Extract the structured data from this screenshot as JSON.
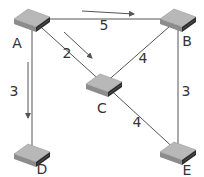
{
  "diagram": {
    "type": "network-graph",
    "nodes": [
      {
        "id": "A",
        "label": "A"
      },
      {
        "id": "B",
        "label": "B"
      },
      {
        "id": "C",
        "label": "C"
      },
      {
        "id": "D",
        "label": "D"
      },
      {
        "id": "E",
        "label": "E"
      }
    ],
    "edges": [
      {
        "from": "A",
        "to": "B",
        "weight": "5",
        "direction_arrow": true
      },
      {
        "from": "A",
        "to": "C",
        "weight": "2",
        "direction_arrow": true
      },
      {
        "from": "A",
        "to": "D",
        "weight": "3",
        "direction_arrow": true
      },
      {
        "from": "C",
        "to": "B",
        "weight": "4",
        "direction_arrow": false
      },
      {
        "from": "C",
        "to": "E",
        "weight": "4",
        "direction_arrow": false
      },
      {
        "from": "B",
        "to": "E",
        "weight": "3",
        "direction_arrow": false
      }
    ],
    "node_icon": "network-switch-icon",
    "colors": {
      "line": "#555555",
      "switch_top": "#b8b8b8",
      "switch_side": "#8c8c8c",
      "switch_front": "#2a2a2a",
      "text": "#333333"
    }
  }
}
